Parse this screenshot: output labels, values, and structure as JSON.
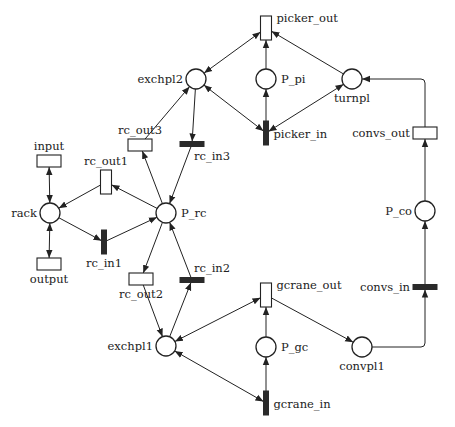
{
  "diagram": {
    "type": "petri-net",
    "places": [
      {
        "id": "rack",
        "label": "rack",
        "x": 50,
        "y": 213,
        "r": 10,
        "label_pos": "left"
      },
      {
        "id": "P_rc",
        "label": "P_rc",
        "x": 166,
        "y": 213,
        "r": 10,
        "label_pos": "right"
      },
      {
        "id": "exchpl2",
        "label": "exchpl2",
        "x": 196,
        "y": 79,
        "r": 10,
        "label_pos": "left"
      },
      {
        "id": "P_pi",
        "label": "P_pi",
        "x": 266,
        "y": 79,
        "r": 10,
        "label_pos": "right"
      },
      {
        "id": "turnpl",
        "label": "turnpl",
        "x": 352,
        "y": 79,
        "r": 10,
        "label_pos": "below"
      },
      {
        "id": "P_co",
        "label": "P_co",
        "x": 425,
        "y": 211,
        "r": 10,
        "label_pos": "left"
      },
      {
        "id": "exchpl1",
        "label": "exchpl1",
        "x": 166,
        "y": 346,
        "r": 10,
        "label_pos": "left"
      },
      {
        "id": "P_gc",
        "label": "P_gc",
        "x": 266,
        "y": 347,
        "r": 10,
        "label_pos": "right"
      },
      {
        "id": "convpl1",
        "label": "convpl1",
        "x": 362,
        "y": 347,
        "r": 10,
        "label_pos": "below"
      }
    ],
    "transitions": [
      {
        "id": "input",
        "label": "input",
        "x": 49,
        "y": 161,
        "w": 24,
        "h": 12,
        "filled": false,
        "label_pos": "above"
      },
      {
        "id": "output",
        "label": "output",
        "x": 49,
        "y": 264,
        "w": 24,
        "h": 12,
        "filled": false,
        "label_pos": "below"
      },
      {
        "id": "rc_out1",
        "label": "rc_out1",
        "x": 106,
        "y": 182,
        "w": 11,
        "h": 24,
        "filled": false,
        "label_pos": "above"
      },
      {
        "id": "rc_in1",
        "label": "rc_in1",
        "x": 104,
        "y": 242,
        "w": 5,
        "h": 24,
        "filled": true,
        "label_pos": "below"
      },
      {
        "id": "rc_out3",
        "label": "rc_out3",
        "x": 140,
        "y": 145,
        "w": 24,
        "h": 12,
        "filled": false,
        "label_pos": "above"
      },
      {
        "id": "rc_in3",
        "label": "rc_in3",
        "x": 192,
        "y": 144,
        "w": 24,
        "h": 5,
        "filled": true,
        "label_pos": "below-right"
      },
      {
        "id": "rc_out2",
        "label": "rc_out2",
        "x": 141,
        "y": 279,
        "w": 24,
        "h": 12,
        "filled": false,
        "label_pos": "below"
      },
      {
        "id": "rc_in2",
        "label": "rc_in2",
        "x": 192,
        "y": 280,
        "w": 24,
        "h": 5,
        "filled": true,
        "label_pos": "above-right"
      },
      {
        "id": "picker_out",
        "label": "picker_out",
        "x": 266,
        "y": 28,
        "w": 11,
        "h": 24,
        "filled": false,
        "label_pos": "right"
      },
      {
        "id": "picker_in",
        "label": "picker_in",
        "x": 266,
        "y": 133,
        "w": 5,
        "h": 24,
        "filled": true,
        "label_pos": "right"
      },
      {
        "id": "convs_out",
        "label": "convs_out",
        "x": 425,
        "y": 133,
        "w": 24,
        "h": 12,
        "filled": false,
        "label_pos": "left"
      },
      {
        "id": "convs_in",
        "label": "convs_in",
        "x": 425,
        "y": 287,
        "w": 24,
        "h": 5,
        "filled": true,
        "label_pos": "left"
      },
      {
        "id": "gcrane_out",
        "label": "gcrane_out",
        "x": 266,
        "y": 295,
        "w": 11,
        "h": 24,
        "filled": false,
        "label_pos": "right"
      },
      {
        "id": "gcrane_in",
        "label": "gcrane_in",
        "x": 266,
        "y": 403,
        "w": 5,
        "h": 24,
        "filled": true,
        "label_pos": "right"
      }
    ],
    "arcs": [
      {
        "from": "input",
        "to": "rack",
        "bidirectional": true
      },
      {
        "from": "rack",
        "to": "output",
        "bidirectional": true
      },
      {
        "from": "rc_out1",
        "to": "rack"
      },
      {
        "from": "rack",
        "to": "rc_in1"
      },
      {
        "from": "rc_in1",
        "to": "P_rc"
      },
      {
        "from": "P_rc",
        "to": "rc_out1"
      },
      {
        "from": "P_rc",
        "to": "rc_out3"
      },
      {
        "from": "rc_out3",
        "to": "exchpl2"
      },
      {
        "from": "exchpl2",
        "to": "rc_in3"
      },
      {
        "from": "rc_in3",
        "to": "P_rc"
      },
      {
        "from": "P_rc",
        "to": "rc_out2"
      },
      {
        "from": "rc_out2",
        "to": "exchpl1"
      },
      {
        "from": "exchpl1",
        "to": "rc_in2"
      },
      {
        "from": "rc_in2",
        "to": "P_rc"
      },
      {
        "from": "exchpl2",
        "to": "picker_out",
        "bidirectional": true
      },
      {
        "from": "exchpl2",
        "to": "picker_in",
        "bidirectional": true
      },
      {
        "from": "P_pi",
        "to": "picker_out"
      },
      {
        "from": "picker_in",
        "to": "P_pi"
      },
      {
        "from": "turnpl",
        "to": "picker_out"
      },
      {
        "from": "picker_in",
        "to": "turnpl",
        "bidirectional": true
      },
      {
        "from": "convs_out",
        "to": "turnpl",
        "routed": "up-left"
      },
      {
        "from": "P_co",
        "to": "convs_out"
      },
      {
        "from": "convs_in",
        "to": "P_co"
      },
      {
        "from": "convpl1",
        "to": "convs_in",
        "routed": "right-up"
      },
      {
        "from": "gcrane_out",
        "to": "convpl1"
      },
      {
        "from": "exchpl1",
        "to": "gcrane_out",
        "bidirectional": true
      },
      {
        "from": "exchpl1",
        "to": "gcrane_in",
        "bidirectional": true
      },
      {
        "from": "gcrane_in",
        "to": "P_gc"
      },
      {
        "from": "P_gc",
        "to": "gcrane_out"
      }
    ]
  }
}
